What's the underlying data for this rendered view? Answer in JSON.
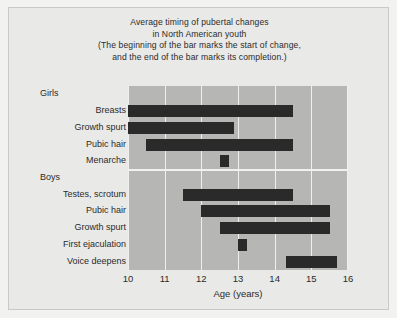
{
  "figure": {
    "background_color": "#e9e9e7",
    "plot_background_color": "#b6b6b4",
    "bar_color": "#2a2a2a",
    "gridline_color": "#efefed"
  },
  "title": {
    "line1": "Average timing of pubertal changes",
    "line2": "in North American youth",
    "line3": "(The beginning of the bar marks the start of change,",
    "line4": "and the end of the bar marks its completion.)"
  },
  "groups": [
    {
      "name": "Girls"
    },
    {
      "name": "Boys"
    }
  ],
  "chart_data": {
    "type": "bar",
    "orientation": "horizontal",
    "subtype": "range-bar",
    "title": "Average timing of pubertal changes in North American youth",
    "subtitle": "(The beginning of the bar marks the start of change, and the end of the bar marks its completion.)",
    "xlabel": "Age (years)",
    "ylabel": "",
    "xlim": [
      10,
      16
    ],
    "xticks": [
      10,
      11,
      12,
      13,
      14,
      15,
      16
    ],
    "xtick_labels": [
      "10",
      "11",
      "12",
      "13",
      "14",
      "15",
      "16"
    ],
    "grid": true,
    "legend": "none",
    "group_labels": [
      "Girls",
      "Boys"
    ],
    "categories": [
      "Girls",
      "Breasts",
      "Growth spurt",
      "Pubic hair",
      "Menarche",
      "Boys",
      "Testes, scrotum",
      "Pubic hair",
      "Growth spurt",
      "First ejaculation",
      "Voice deepens"
    ],
    "bars": [
      {
        "label": "Girls",
        "group": "Girls",
        "is_group_header": true,
        "start": null,
        "end": null
      },
      {
        "label": "Breasts",
        "group": "Girls",
        "is_group_header": false,
        "start": 10.0,
        "end": 14.5
      },
      {
        "label": "Growth spurt",
        "group": "Girls",
        "is_group_header": false,
        "start": 10.0,
        "end": 12.9
      },
      {
        "label": "Pubic hair",
        "group": "Girls",
        "is_group_header": false,
        "start": 10.5,
        "end": 14.5
      },
      {
        "label": "Menarche",
        "group": "Girls",
        "is_group_header": false,
        "start": 12.5,
        "end": 12.75
      },
      {
        "label": "Boys",
        "group": "Boys",
        "is_group_header": true,
        "start": null,
        "end": null
      },
      {
        "label": "Testes, scrotum",
        "group": "Boys",
        "is_group_header": false,
        "start": 11.5,
        "end": 14.5
      },
      {
        "label": "Pubic hair",
        "group": "Boys",
        "is_group_header": false,
        "start": 12.0,
        "end": 15.5
      },
      {
        "label": "Growth spurt",
        "group": "Boys",
        "is_group_header": false,
        "start": 12.5,
        "end": 15.5
      },
      {
        "label": "First ejaculation",
        "group": "Boys",
        "is_group_header": false,
        "start": 13.0,
        "end": 13.25
      },
      {
        "label": "Voice deepens",
        "group": "Boys",
        "is_group_header": false,
        "start": 14.3,
        "end": 15.7
      }
    ]
  }
}
